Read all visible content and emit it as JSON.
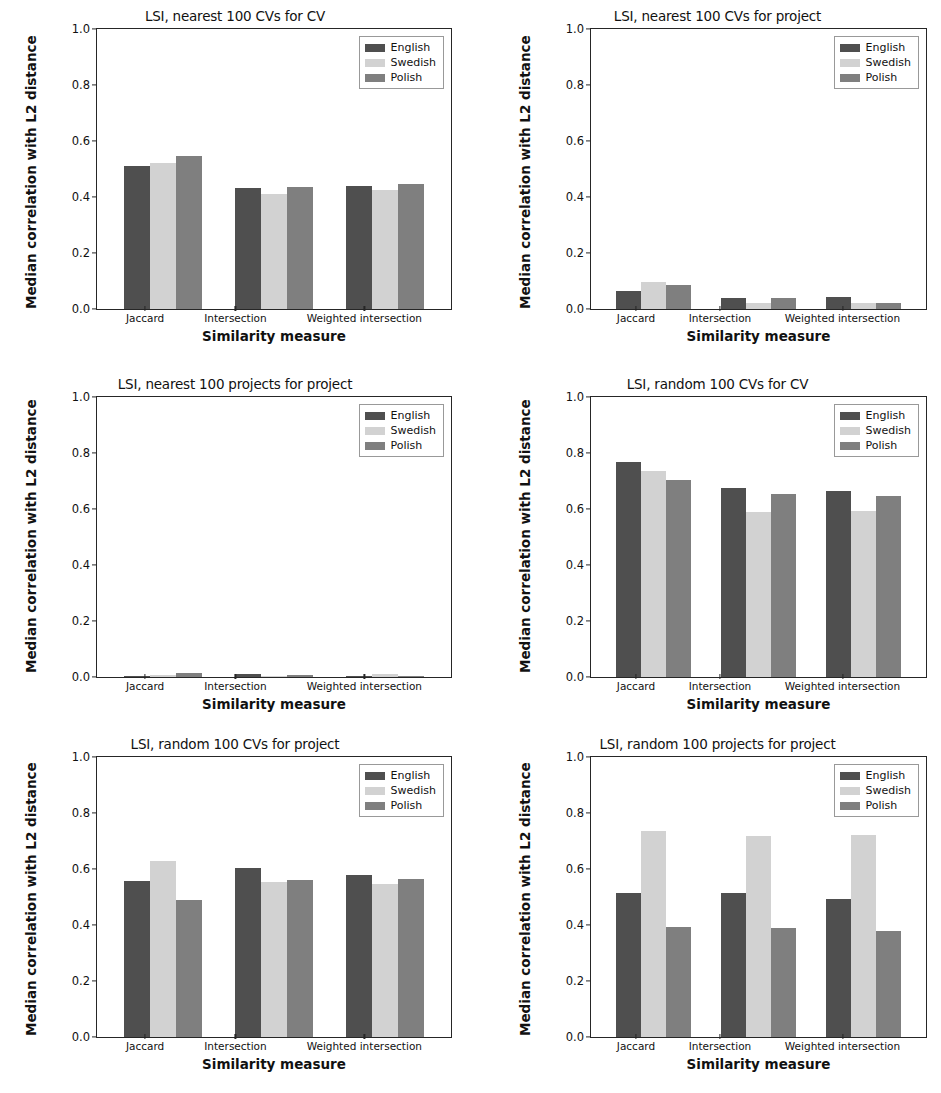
{
  "figure": {
    "layout": "2 columns x 3 rows",
    "ylabel": "Median correlation with L2 distance",
    "xlabel": "Similarity measure",
    "categories": [
      "Jaccard",
      "Intersection",
      "Weighted intersection"
    ],
    "yticks": [
      "1.0",
      "0.8",
      "0.6",
      "0.4",
      "0.2",
      "0.0"
    ],
    "legend": [
      {
        "label": "English",
        "color": "#4f4f4f"
      },
      {
        "label": "Swedish",
        "color": "#d2d2d2"
      },
      {
        "label": "Polish",
        "color": "#7f7f7f"
      }
    ]
  },
  "chart_data": [
    {
      "type": "bar",
      "title": "LSI, nearest 100 CVs for CV",
      "xlabel": "Similarity measure",
      "ylabel": "Median correlation with L2 distance",
      "ylim": [
        0.0,
        1.0
      ],
      "yticks": [
        0.0,
        0.2,
        0.4,
        0.6,
        0.8,
        1.0
      ],
      "grid": false,
      "legend_position": "upper right",
      "categories": [
        "Jaccard",
        "Intersection",
        "Weighted intersection"
      ],
      "series": [
        {
          "name": "English",
          "values": [
            0.51,
            0.433,
            0.44
          ]
        },
        {
          "name": "Swedish",
          "values": [
            0.521,
            0.412,
            0.426
          ]
        },
        {
          "name": "Polish",
          "values": [
            0.548,
            0.434,
            0.448
          ]
        }
      ]
    },
    {
      "type": "bar",
      "title": "LSI, nearest 100 CVs for project",
      "xlabel": "Similarity measure",
      "ylabel": "Median correlation with L2 distance",
      "ylim": [
        0.0,
        1.0
      ],
      "yticks": [
        0.0,
        0.2,
        0.4,
        0.6,
        0.8,
        1.0
      ],
      "grid": false,
      "legend_position": "upper right",
      "categories": [
        "Jaccard",
        "Intersection",
        "Weighted intersection"
      ],
      "series": [
        {
          "name": "English",
          "values": [
            0.065,
            0.038,
            0.044
          ]
        },
        {
          "name": "Swedish",
          "values": [
            0.098,
            0.022,
            0.022
          ]
        },
        {
          "name": "Polish",
          "values": [
            0.085,
            0.04,
            0.023
          ]
        }
      ]
    },
    {
      "type": "bar",
      "title": "LSI, nearest 100 projects for project",
      "xlabel": "Similarity measure",
      "ylabel": "Median correlation with L2 distance",
      "ylim": [
        0.0,
        1.0
      ],
      "yticks": [
        0.0,
        0.2,
        0.4,
        0.6,
        0.8,
        1.0
      ],
      "grid": false,
      "legend_position": "upper right",
      "categories": [
        "Jaccard",
        "Intersection",
        "Weighted intersection"
      ],
      "series": [
        {
          "name": "English",
          "values": [
            0.004,
            0.01,
            0.002
          ]
        },
        {
          "name": "Swedish",
          "values": [
            0.007,
            0.003,
            0.011
          ]
        },
        {
          "name": "Polish",
          "values": [
            0.014,
            0.008,
            0.003
          ]
        }
      ]
    },
    {
      "type": "bar",
      "title": "LSI, random 100 CVs for CV",
      "xlabel": "Similarity measure",
      "ylabel": "Median correlation with L2 distance",
      "ylim": [
        0.0,
        1.0
      ],
      "yticks": [
        0.0,
        0.2,
        0.4,
        0.6,
        0.8,
        1.0
      ],
      "grid": false,
      "legend_position": "upper right",
      "categories": [
        "Jaccard",
        "Intersection",
        "Weighted intersection"
      ],
      "series": [
        {
          "name": "English",
          "values": [
            0.768,
            0.676,
            0.663
          ]
        },
        {
          "name": "Swedish",
          "values": [
            0.734,
            0.59,
            0.592
          ]
        },
        {
          "name": "Polish",
          "values": [
            0.705,
            0.655,
            0.647
          ]
        }
      ]
    },
    {
      "type": "bar",
      "title": "LSI, random 100 CVs for project",
      "xlabel": "Similarity measure",
      "ylabel": "Median correlation with L2 distance",
      "ylim": [
        0.0,
        1.0
      ],
      "yticks": [
        0.0,
        0.2,
        0.4,
        0.6,
        0.8,
        1.0
      ],
      "grid": false,
      "legend_position": "upper right",
      "categories": [
        "Jaccard",
        "Intersection",
        "Weighted intersection"
      ],
      "series": [
        {
          "name": "English",
          "values": [
            0.558,
            0.602,
            0.578
          ]
        },
        {
          "name": "Swedish",
          "values": [
            0.628,
            0.552,
            0.547
          ]
        },
        {
          "name": "Polish",
          "values": [
            0.49,
            0.56,
            0.565
          ]
        }
      ]
    },
    {
      "type": "bar",
      "title": "LSI, random 100 projects for project",
      "xlabel": "Similarity measure",
      "ylabel": "Median correlation with L2 distance",
      "ylim": [
        0.0,
        1.0
      ],
      "yticks": [
        0.0,
        0.2,
        0.4,
        0.6,
        0.8,
        1.0
      ],
      "grid": false,
      "legend_position": "upper right",
      "categories": [
        "Jaccard",
        "Intersection",
        "Weighted intersection"
      ],
      "series": [
        {
          "name": "English",
          "values": [
            0.513,
            0.513,
            0.494
          ]
        },
        {
          "name": "Swedish",
          "values": [
            0.735,
            0.718,
            0.722
          ]
        },
        {
          "name": "Polish",
          "values": [
            0.392,
            0.391,
            0.377
          ]
        }
      ]
    }
  ]
}
